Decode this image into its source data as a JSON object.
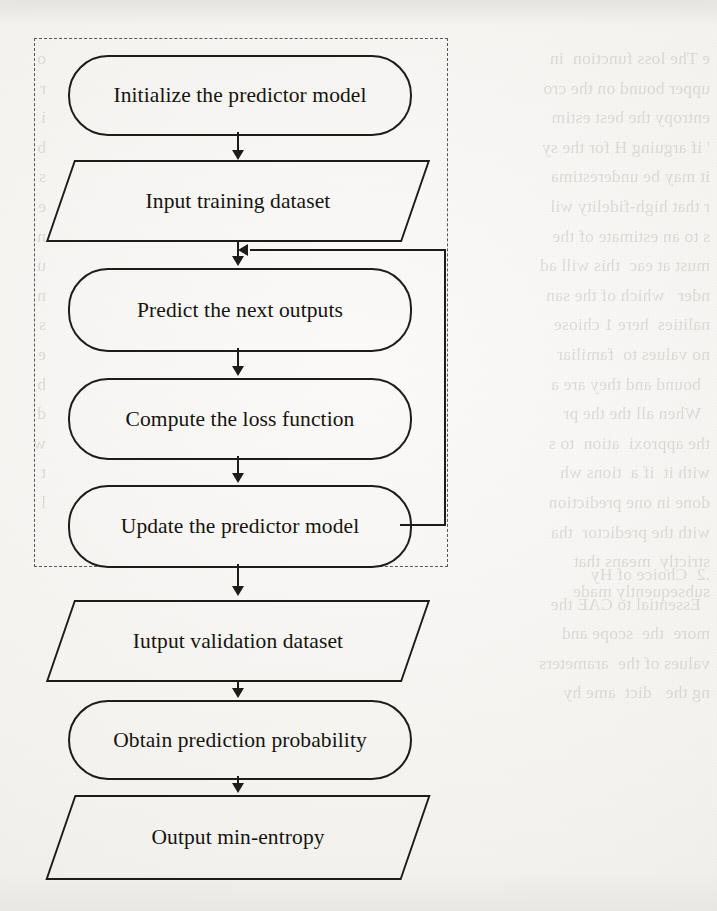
{
  "document": {
    "type": "scanned-page-flowchart",
    "background_color": "#f4f3f0",
    "ink_color": "#1d1c19"
  },
  "flowchart": {
    "title": "",
    "group_box": {
      "name": "training-loop-group",
      "style": "dashed"
    },
    "nodes": [
      {
        "id": "init",
        "label": "Initialize the predictor model",
        "shape": "rounded-rectangle"
      },
      {
        "id": "input_ds",
        "label": "Input training dataset",
        "shape": "parallelogram"
      },
      {
        "id": "predict",
        "label": "Predict the next outputs",
        "shape": "rounded-rectangle"
      },
      {
        "id": "loss",
        "label": "Compute the loss function",
        "shape": "rounded-rectangle"
      },
      {
        "id": "update",
        "label": "Update the predictor model",
        "shape": "rounded-rectangle"
      },
      {
        "id": "valid_ds",
        "label": "Iutput validation dataset",
        "shape": "parallelogram"
      },
      {
        "id": "prob",
        "label": "Obtain prediction probability",
        "shape": "rounded-rectangle"
      },
      {
        "id": "out_ent",
        "label": "Output min-entropy",
        "shape": "parallelogram"
      }
    ],
    "edges": [
      {
        "from": "init",
        "to": "input_ds",
        "kind": "arrow-down"
      },
      {
        "from": "input_ds",
        "to": "predict",
        "kind": "arrow-down"
      },
      {
        "from": "predict",
        "to": "loss",
        "kind": "arrow-down"
      },
      {
        "from": "loss",
        "to": "update",
        "kind": "arrow-down"
      },
      {
        "from": "update",
        "to": "valid_ds",
        "kind": "arrow-down"
      },
      {
        "from": "valid_ds",
        "to": "prob",
        "kind": "arrow-down"
      },
      {
        "from": "prob",
        "to": "out_ent",
        "kind": "arrow-down"
      },
      {
        "from": "update",
        "to": "predict",
        "kind": "feedback-loop-right"
      }
    ]
  },
  "bleed_through": {
    "right_column": "e The loss function  in\nupper bound on the cro\nentropy the best estim\n' if arguing H for the sy\nit may be underestima\nr that high-fidelity wil\ns to an estimate of the\nmust at eac  this will ad\nnder   which of the san\nnalities  here 1 chiose\nno values to  familiar\n  bound and they are a\n  When all the the pr\nthe approxi  ation  to s\nwith it  if a  tions wh\ndone in one prediction\nwith the predictor  tha\nstrictly  means that\nsubsequently made",
    "left_column": "o\nr\ni\nb\ns\ne\nn\nu\nn\ns\ne\nb\nd\nw\nt\nl",
    "lower_right": ".2  Choice of Hy\n  Essential to CAE the\nmore  the  scope and\nvalues of the  arameters\nng the   dict  ame hy"
  }
}
